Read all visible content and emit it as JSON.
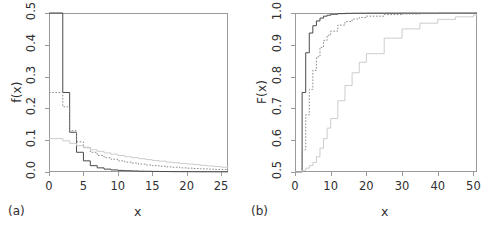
{
  "figure": {
    "panels": [
      {
        "tag": "(a)",
        "xlabel": "x",
        "ylabel": "f(x)",
        "xticks": [
          "0",
          "5",
          "10",
          "15",
          "20",
          "25"
        ],
        "yticks": [
          "0.0",
          "0.1",
          "0.2",
          "0.3",
          "0.4",
          "0.5"
        ]
      },
      {
        "tag": "(b)",
        "xlabel": "x",
        "ylabel": "F(x)",
        "xticks": [
          "0",
          "10",
          "20",
          "30",
          "40",
          "50"
        ],
        "yticks": [
          "0.5",
          "0.6",
          "0.7",
          "0.8",
          "0.9",
          "1.0"
        ]
      }
    ]
  },
  "colors": {
    "series_1": "#4a4a4a",
    "series_2": "#8c8c8c",
    "series_3": "#cccccc",
    "axis": "#9a9a9a",
    "text": "#2f2f2f",
    "background": "#ffffff"
  },
  "chart_data": [
    {
      "type": "line",
      "title": "",
      "subtitle": "",
      "panel": "(a)",
      "xlabel": "x",
      "ylabel": "f(x)",
      "xlim": [
        0,
        26
      ],
      "ylim": [
        0.0,
        0.5
      ],
      "xticks": [
        0,
        5,
        10,
        15,
        20,
        25
      ],
      "yticks": [
        0.0,
        0.1,
        0.2,
        0.3,
        0.4,
        0.5
      ],
      "grid": false,
      "legend": "none",
      "drawstyle": "steps-post",
      "series": [
        {
          "name": "series_1",
          "style": "solid",
          "color": "#4a4a4a",
          "x": [
            1,
            2,
            3,
            4,
            5,
            6,
            7,
            8,
            9,
            10,
            11,
            12,
            13,
            14,
            15,
            16,
            17,
            18,
            19,
            20,
            21,
            22,
            23,
            24,
            25,
            26
          ],
          "values": [
            0.5,
            0.25,
            0.125,
            0.062,
            0.035,
            0.02,
            0.013,
            0.009,
            0.0065,
            0.005,
            0.004,
            0.0032,
            0.0026,
            0.0022,
            0.0018,
            0.0015,
            0.0013,
            0.0011,
            0.001,
            0.0009,
            0.0008,
            0.0007,
            0.0006,
            0.0005,
            0.0005,
            0.0004
          ]
        },
        {
          "name": "series_2",
          "style": "dotted",
          "color": "#8c8c8c",
          "x": [
            1,
            2,
            3,
            4,
            5,
            6,
            7,
            8,
            9,
            10,
            11,
            12,
            13,
            14,
            15,
            16,
            17,
            18,
            19,
            20,
            21,
            22,
            23,
            24,
            25,
            26
          ],
          "values": [
            0.25,
            0.205,
            0.13,
            0.095,
            0.078,
            0.062,
            0.052,
            0.045,
            0.04,
            0.035,
            0.031,
            0.028,
            0.025,
            0.022,
            0.02,
            0.018,
            0.016,
            0.015,
            0.013,
            0.012,
            0.011,
            0.01,
            0.009,
            0.008,
            0.008,
            0.007
          ]
        },
        {
          "name": "series_3",
          "style": "solid",
          "color": "#cccccc",
          "x": [
            1,
            2,
            3,
            4,
            5,
            6,
            7,
            8,
            9,
            10,
            11,
            12,
            13,
            14,
            15,
            16,
            17,
            18,
            19,
            20,
            21,
            22,
            23,
            24,
            25,
            26
          ],
          "values": [
            0.105,
            0.098,
            0.09,
            0.083,
            0.076,
            0.07,
            0.065,
            0.06,
            0.056,
            0.052,
            0.048,
            0.045,
            0.042,
            0.039,
            0.036,
            0.034,
            0.031,
            0.029,
            0.027,
            0.025,
            0.023,
            0.021,
            0.019,
            0.017,
            0.015,
            0.013
          ]
        }
      ]
    },
    {
      "type": "line",
      "title": "",
      "subtitle": "",
      "panel": "(b)",
      "xlabel": "x",
      "ylabel": "F(x)",
      "xlim": [
        0,
        51
      ],
      "ylim": [
        0.5,
        1.0
      ],
      "xticks": [
        0,
        10,
        20,
        30,
        40,
        50
      ],
      "yticks": [
        0.5,
        0.6,
        0.7,
        0.8,
        0.9,
        1.0
      ],
      "grid": false,
      "legend": "none",
      "drawstyle": "steps-post",
      "series": [
        {
          "name": "series_1",
          "style": "solid",
          "color": "#4a4a4a",
          "x": [
            1,
            2,
            3,
            4,
            5,
            6,
            7,
            8,
            9,
            10,
            12,
            14,
            16,
            18,
            20,
            25,
            30,
            35,
            40,
            45,
            50
          ],
          "values": [
            0.5,
            0.75,
            0.875,
            0.937,
            0.96,
            0.975,
            0.984,
            0.99,
            0.993,
            0.996,
            0.998,
            0.999,
            0.9993,
            0.9995,
            0.9997,
            0.9998,
            0.9999,
            0.9999,
            1.0,
            1.0,
            1.0
          ]
        },
        {
          "name": "series_2",
          "style": "dotted",
          "color": "#8c8c8c",
          "x": [
            1,
            2,
            3,
            4,
            5,
            6,
            7,
            8,
            9,
            10,
            12,
            14,
            16,
            18,
            20,
            25,
            30,
            35,
            40,
            45,
            50
          ],
          "values": [
            0.5,
            0.57,
            0.68,
            0.76,
            0.82,
            0.862,
            0.892,
            0.914,
            0.93,
            0.943,
            0.962,
            0.973,
            0.981,
            0.986,
            0.99,
            0.995,
            0.997,
            0.998,
            0.999,
            0.999,
            1.0
          ]
        },
        {
          "name": "series_3",
          "style": "solid",
          "color": "#cccccc",
          "x": [
            1,
            2,
            3,
            4,
            5,
            6,
            7,
            8,
            9,
            10,
            12,
            14,
            16,
            18,
            20,
            25,
            30,
            35,
            40,
            45,
            50
          ],
          "values": [
            0.5,
            0.505,
            0.512,
            0.52,
            0.53,
            0.548,
            0.575,
            0.605,
            0.638,
            0.668,
            0.724,
            0.772,
            0.812,
            0.845,
            0.872,
            0.921,
            0.95,
            0.968,
            0.98,
            0.988,
            0.994
          ]
        }
      ]
    }
  ]
}
